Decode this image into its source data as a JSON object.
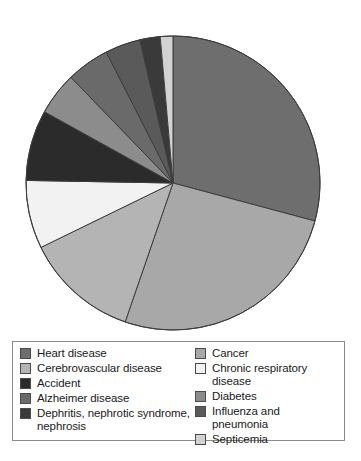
{
  "chart_data": {
    "type": "pie",
    "title": "",
    "legend_position": "bottom",
    "categories": [
      "Heart disease",
      "Cancer",
      "Cerebrovascular disease",
      "Chronic respiratory disease",
      "Accident",
      "Diabetes",
      "Alzheimer disease",
      "Influenza and pneumonia",
      "Dephritis, nephrotic syndrome, nephrosis",
      "Septicemia"
    ],
    "values": [
      29.2,
      26.1,
      12.5,
      7.5,
      7.8,
      4.7,
      4.7,
      3.9,
      2.2,
      1.4
    ],
    "unit": "percent",
    "start_angle_deg": 0,
    "direction": "clockwise",
    "slices": [
      {
        "label": "Heart disease",
        "value": 29.2,
        "sweep_deg": 105.0,
        "color": "#6e6e6e"
      },
      {
        "label": "Cancer",
        "value": 26.1,
        "sweep_deg": 94.0,
        "color": "#a8a8a8"
      },
      {
        "label": "Cerebrovascular disease",
        "value": 12.5,
        "sweep_deg": 45.0,
        "color": "#b4b4b4"
      },
      {
        "label": "Chronic respiratory disease",
        "value": 7.5,
        "sweep_deg": 27.0,
        "color": "#f2f2f2"
      },
      {
        "label": "Accident",
        "value": 7.8,
        "sweep_deg": 28.0,
        "color": "#2b2b2b"
      },
      {
        "label": "Diabetes",
        "value": 4.7,
        "sweep_deg": 17.0,
        "color": "#8c8c8c"
      },
      {
        "label": "Alzheimer disease",
        "value": 4.7,
        "sweep_deg": 17.0,
        "color": "#6a6a6a"
      },
      {
        "label": "Influenza and pneumonia",
        "value": 3.9,
        "sweep_deg": 14.0,
        "color": "#5a5a5a"
      },
      {
        "label": "Dephritis, nephrotic syndrome, nephrosis",
        "value": 2.2,
        "sweep_deg": 8.0,
        "color": "#3a3a3a"
      },
      {
        "label": "Septicemia",
        "value": 1.4,
        "sweep_deg": 5.0,
        "color": "#d2d2d2"
      }
    ]
  },
  "legend": {
    "columns": [
      {
        "items": [
          {
            "label": "Heart disease",
            "color": "#6e6e6e"
          },
          {
            "label": "Cerebrovascular disease",
            "color": "#b4b4b4"
          },
          {
            "label": "Accident",
            "color": "#2b2b2b"
          },
          {
            "label": "Alzheimer disease",
            "color": "#6a6a6a"
          },
          {
            "label": "Dephritis, nephrotic syndrome,\nnephrosis",
            "color": "#3a3a3a"
          }
        ]
      },
      {
        "items": [
          {
            "label": "Cancer",
            "color": "#a8a8a8"
          },
          {
            "label": "Chronic respiratory disease",
            "color": "#f2f2f2"
          },
          {
            "label": "Diabetes",
            "color": "#8c8c8c"
          },
          {
            "label": "Influenza and pneumonia",
            "color": "#5a5a5a"
          },
          {
            "label": "Septicemia",
            "color": "#d2d2d2"
          }
        ]
      }
    ]
  },
  "style": {
    "pie_center_x": 173,
    "pie_center_y": 183,
    "pie_radius": 147,
    "slice_stroke": "#3d3d3d",
    "legend_border": "#8a8a8a"
  }
}
